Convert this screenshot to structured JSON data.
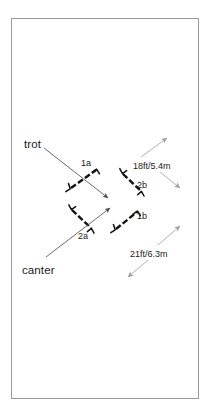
{
  "diagram": {
    "type": "equestrian-gymnastic-grid-course-diagram",
    "background_color": "#ffffff",
    "border_color": "#9a9a9a",
    "jump_color": "#111111",
    "approach_arrow_color": "#5a5a5a",
    "distance_arrow_color": "#9a9a9a"
  },
  "gaits": [
    {
      "id": "trot",
      "label": "trot",
      "x": 24,
      "y": 139
    },
    {
      "id": "canter",
      "label": "canter",
      "x": 22,
      "y": 265
    }
  ],
  "jumps": [
    {
      "id": "1a",
      "label": "1a",
      "label_x": 81,
      "label_y": 159
    },
    {
      "id": "2b",
      "label": "2b",
      "label_x": 137,
      "label_y": 181
    },
    {
      "id": "2a",
      "label": "2a",
      "label_x": 78,
      "label_y": 232
    },
    {
      "id": "1b",
      "label": "1b",
      "label_x": 137,
      "label_y": 212
    }
  ],
  "distances": [
    {
      "id": "d1",
      "label": "18ft/5.4m",
      "label_x": 133,
      "label_y": 162
    },
    {
      "id": "d2",
      "label": "21ft/6.3m",
      "label_x": 130,
      "label_y": 250
    }
  ]
}
